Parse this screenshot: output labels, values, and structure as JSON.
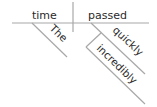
{
  "diagram": {
    "type": "reed-kellogg-sentence-diagram",
    "sentence": "The time passed incredibly quickly",
    "subject": "time",
    "verb": "passed",
    "modifiers": {
      "subject_modifier": "The",
      "verb_modifier": "quickly",
      "adverb_modifier": "incredibly"
    },
    "line_color": "#a8a8a8",
    "text_color": "#2a2a2a"
  }
}
